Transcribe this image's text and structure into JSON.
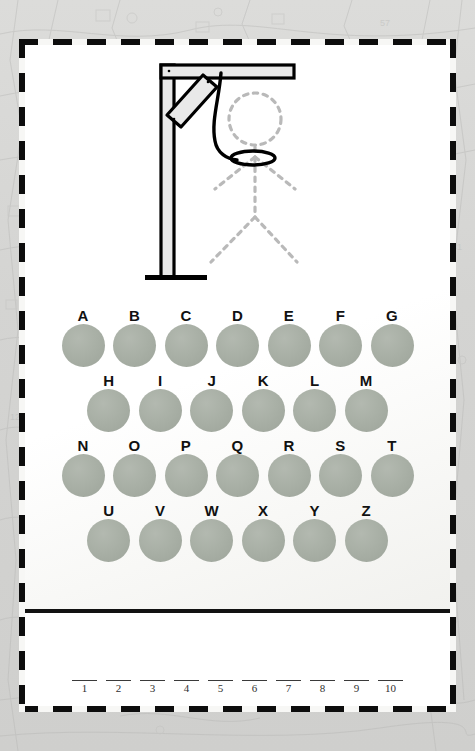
{
  "app": {
    "title": "Hangman",
    "background_color": "#d6d6d4",
    "frame_color": "#0d0d0d",
    "paper_color": "#ffffff"
  },
  "gallows": {
    "name": "gallows-illustration",
    "description": "Wooden gallows with rope noose and dashed stick-figure outline",
    "post_color": "#e8e8e8",
    "outline_color": "#000000",
    "figure_style": "dashed",
    "figure_color": "#b5b5b5",
    "rope_color": "#000000",
    "parts_revealed": 0,
    "parts": [
      "head",
      "body",
      "left-arm",
      "right-arm",
      "left-leg",
      "right-leg"
    ]
  },
  "keyboard": {
    "name": "alphabet-keyboard",
    "disc_color": "#a7aea4",
    "label_color": "#111111",
    "rows": [
      {
        "indent": false,
        "letters": [
          "A",
          "B",
          "C",
          "D",
          "E",
          "F",
          "G"
        ]
      },
      {
        "indent": true,
        "letters": [
          "H",
          "I",
          "J",
          "K",
          "L",
          "M"
        ]
      },
      {
        "indent": false,
        "letters": [
          "N",
          "O",
          "P",
          "Q",
          "R",
          "S",
          "T"
        ]
      },
      {
        "indent": true,
        "letters": [
          "U",
          "V",
          "W",
          "X",
          "Y",
          "Z"
        ]
      }
    ]
  },
  "answer": {
    "name": "answer-blanks",
    "slot_count": 10,
    "slots": [
      {
        "index": "1",
        "letter": ""
      },
      {
        "index": "2",
        "letter": ""
      },
      {
        "index": "3",
        "letter": ""
      },
      {
        "index": "4",
        "letter": ""
      },
      {
        "index": "5",
        "letter": ""
      },
      {
        "index": "6",
        "letter": ""
      },
      {
        "index": "7",
        "letter": ""
      },
      {
        "index": "8",
        "letter": ""
      },
      {
        "index": "9",
        "letter": ""
      },
      {
        "index": "10",
        "letter": ""
      }
    ]
  }
}
